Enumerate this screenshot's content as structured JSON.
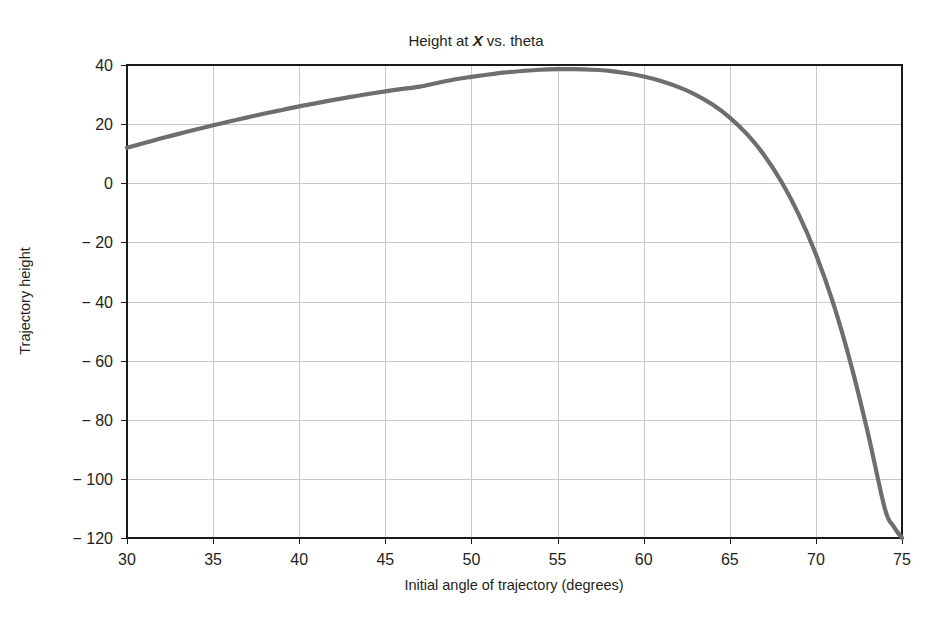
{
  "chart_data": {
    "type": "line",
    "title": "Height at X vs. theta",
    "title_prefix": "Height at ",
    "title_emphasis": "X",
    "title_suffix": " vs. theta",
    "xlabel": "Initial angle of trajectory (degrees)",
    "ylabel": "Trajectory height",
    "xlim": [
      30,
      75
    ],
    "ylim": [
      -120,
      40
    ],
    "xticks": [
      30,
      35,
      40,
      45,
      50,
      55,
      60,
      65,
      70,
      75
    ],
    "yticks": [
      40,
      20,
      0,
      -20,
      -40,
      -60,
      -80,
      -100,
      -120
    ],
    "xtick_labels": [
      "30",
      "35",
      "40",
      "45",
      "50",
      "55",
      "60",
      "65",
      "70",
      "75"
    ],
    "ytick_labels": [
      "40",
      "20",
      "0",
      "− 20",
      "− 40",
      "− 60",
      "− 80",
      "− 100",
      "− 120"
    ],
    "grid": true,
    "legend": "none",
    "series": [
      {
        "name": "Trajectory height at X",
        "color": "#6e6e6e",
        "x": [
          30,
          31,
          32,
          33,
          34,
          35,
          36,
          37,
          38,
          39,
          40,
          41,
          42,
          43,
          44,
          45,
          46,
          47,
          48,
          49,
          50,
          51,
          52,
          53,
          54,
          55,
          56,
          57,
          58,
          59,
          60,
          61,
          62,
          63,
          64,
          65,
          66,
          67,
          68,
          69,
          70,
          71,
          72,
          73,
          74,
          74.5,
          75
        ],
        "y": [
          12.0,
          13.6,
          15.2,
          16.7,
          18.2,
          19.6,
          21.0,
          22.3,
          23.6,
          24.8,
          26.0,
          27.1,
          28.2,
          29.2,
          30.2,
          31.1,
          31.9,
          32.7,
          33.9,
          35.1,
          36.0,
          36.8,
          37.5,
          38.0,
          38.4,
          38.6,
          38.6,
          38.4,
          38.0,
          37.2,
          36.1,
          34.6,
          32.6,
          30.0,
          26.6,
          22.2,
          16.6,
          9.5,
          0.5,
          -10.5,
          -24.0,
          -40.5,
          -60.5,
          -84.0,
          -110.0,
          -116.0,
          -120.0
        ]
      }
    ],
    "annotations": []
  },
  "figure": {
    "background": "#ffffff",
    "frame_color": "#1a1a1a",
    "grid_color": "#c9c9c9",
    "text_color": "#231f20"
  },
  "caption": {
    "ghost_text": ""
  }
}
